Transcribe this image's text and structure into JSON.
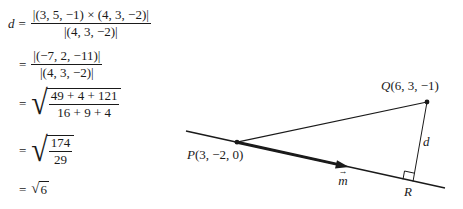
{
  "derivation": {
    "lhs_var": "d",
    "equals": "=",
    "step1": {
      "numerator": "|(3, 5, −1) × (4, 3, −2)|",
      "denominator": "|(4, 3, −2)|"
    },
    "step2": {
      "numerator": "|(−7, 2, −11)|",
      "denominator": "|(4, 3, −2)|"
    },
    "step3": {
      "numerator": "49 + 4 + 121",
      "denominator": "16 + 9 + 4"
    },
    "step4": {
      "numerator": "174",
      "denominator": "29"
    },
    "step5": {
      "radical_sign": "√",
      "radicand": "6"
    }
  },
  "diagram": {
    "point_p": {
      "letter": "P",
      "coords": "(3,  −2, 0)"
    },
    "point_q": {
      "letter": "Q",
      "coords": "(6, 3,  −1)"
    },
    "point_r": {
      "letter": "R"
    },
    "distance_label": "d",
    "direction_vector": {
      "letter": "m",
      "arrow": "→"
    },
    "colors": {
      "ink": "#1a1a1a",
      "background": "#ffffff"
    }
  }
}
